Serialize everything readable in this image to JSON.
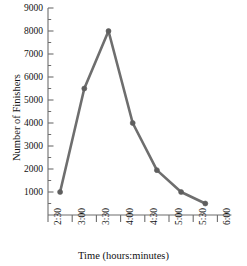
{
  "chart_data": {
    "type": "line",
    "title": "",
    "xlabel": "Time (hours:minutes)",
    "ylabel": "Number of Finishers",
    "x_tick_labels": [
      "2:30",
      "3:00",
      "3:30",
      "4:00",
      "4:30",
      "5:00",
      "5:30",
      "6:00"
    ],
    "y_tick_labels": [
      "1000",
      "2000",
      "3000",
      "4000",
      "5000",
      "6000",
      "7000",
      "8000",
      "9000"
    ],
    "y_tick_values": [
      1000,
      2000,
      3000,
      4000,
      5000,
      6000,
      7000,
      8000,
      9000
    ],
    "ylim": [
      500,
      9000
    ],
    "xlim": [
      "2:30",
      "6:00"
    ],
    "grid": false,
    "legend": null,
    "minor_ticks": true,
    "series": [
      {
        "name": "Finishers",
        "color": "#6e6e6e",
        "marker": "circle",
        "x": [
          "2:45",
          "3:15",
          "3:45",
          "4:15",
          "4:45",
          "5:15",
          "5:45"
        ],
        "values": [
          1000,
          5500,
          8000,
          4000,
          1950,
          1000,
          500
        ]
      }
    ]
  },
  "axis": {
    "y_title": "Number of Finishers",
    "x_title": "Time (hours:minutes)"
  },
  "colors": {
    "line": "#6e6e6e",
    "marker": "#5e5e5e",
    "axis": "#6d6d6d",
    "text": "#111111",
    "background": "#ffffff"
  }
}
